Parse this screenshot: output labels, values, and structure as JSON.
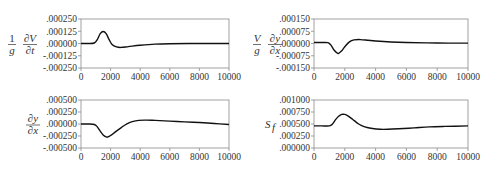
{
  "chart_data": [
    {
      "type": "line",
      "id": "dVdt",
      "ylabel": "1/g ∂V/∂t",
      "ylabel_parts": {
        "num_left": "1",
        "den_left": "g",
        "num_right": "∂V",
        "den_right": "∂t"
      },
      "xlabel": "",
      "xlim": [
        0,
        10000
      ],
      "ylim": [
        -0.00025,
        0.00025
      ],
      "xticks": [
        0,
        2000,
        4000,
        6000,
        8000,
        10000
      ],
      "xtick_labels": [
        "0",
        "2000",
        "4000",
        "6000",
        "8000",
        "10000"
      ],
      "yticks": [
        0.00025,
        0.000125,
        0,
        -0.000125,
        -0.00025
      ],
      "ytick_labels": [
        ".000250",
        ".000125",
        ".000000",
        "-.000125",
        "-.000250"
      ],
      "grid": false,
      "x": [
        0,
        500,
        900,
        1100,
        1300,
        1500,
        1700,
        1900,
        2100,
        2400,
        2700,
        3200,
        4000,
        5000,
        6000,
        8000,
        10000
      ],
      "y": [
        0,
        0,
        5e-06,
        4e-05,
        0.0001,
        0.000122,
        0.0001,
        4e-05,
        -1e-05,
        -3.5e-05,
        -4e-05,
        -3.2e-05,
        -1.8e-05,
        -6e-06,
        -2e-06,
        0,
        0
      ]
    },
    {
      "type": "line",
      "id": "V_g_dydx",
      "ylabel": "V/g ∂y/∂x",
      "ylabel_parts": {
        "num_left": "V",
        "den_left": "g",
        "num_right": "∂y",
        "den_right": "∂x"
      },
      "xlabel": "",
      "xlim": [
        0,
        10000
      ],
      "ylim": [
        -0.00015,
        0.00015
      ],
      "xticks": [
        0,
        2000,
        4000,
        6000,
        8000,
        10000
      ],
      "xtick_labels": [
        "0",
        "2000",
        "4000",
        "6000",
        "8000",
        "10000"
      ],
      "yticks": [
        0.00015,
        7.5e-05,
        0,
        -7.5e-05,
        -0.00015
      ],
      "ytick_labels": [
        ".000150",
        ".000075",
        ".000000",
        "-.000075",
        "-.000150"
      ],
      "grid": false,
      "x": [
        0,
        500,
        900,
        1100,
        1300,
        1500,
        1600,
        1800,
        2000,
        2300,
        2600,
        3000,
        3500,
        4000,
        5000,
        6000,
        8000,
        10000
      ],
      "y": [
        6e-06,
        6e-06,
        5e-06,
        -1e-05,
        -4e-05,
        -5.8e-05,
        -6e-05,
        -4.5e-05,
        -2e-05,
        1e-05,
        2.2e-05,
        2.4e-05,
        2e-05,
        1.5e-05,
        9e-06,
        6e-06,
        3e-06,
        2e-06
      ]
    },
    {
      "type": "line",
      "id": "dydx",
      "ylabel": "∂y/∂x",
      "ylabel_parts": {
        "num": "∂y",
        "den": "∂x"
      },
      "xlabel": "",
      "xlim": [
        0,
        10000
      ],
      "ylim": [
        -0.0005,
        0.0005
      ],
      "xticks": [
        0,
        2000,
        4000,
        6000,
        8000,
        10000
      ],
      "xtick_labels": [
        "0",
        "2000",
        "4000",
        "6000",
        "8000",
        "10000"
      ],
      "yticks": [
        0.0005,
        0.00025,
        0,
        -0.00025,
        -0.0005
      ],
      "ytick_labels": [
        ".000500",
        ".000250",
        ".000000",
        "-.000250",
        "-.000500"
      ],
      "grid": false,
      "x": [
        0,
        500,
        900,
        1100,
        1300,
        1500,
        1700,
        1800,
        2000,
        2300,
        2700,
        3100,
        3600,
        4300,
        5000,
        6000,
        7000,
        8000,
        9000,
        10000
      ],
      "y": [
        0,
        0,
        -1e-05,
        -6e-05,
        -0.00015,
        -0.00023,
        -0.00027,
        -0.00027,
        -0.00024,
        -0.00017,
        -8e-05,
        5e-06,
        6e-05,
        8e-05,
        7.5e-05,
        6e-05,
        4.5e-05,
        3e-05,
        1e-05,
        -1e-05
      ]
    },
    {
      "type": "line",
      "id": "Sf",
      "ylabel": "S_f",
      "ylabel_parts": {
        "main": "S",
        "sub": "f"
      },
      "xlabel": "",
      "xlim": [
        0,
        10000
      ],
      "ylim": [
        0,
        0.001
      ],
      "xticks": [
        0,
        2000,
        4000,
        6000,
        8000,
        10000
      ],
      "xtick_labels": [
        "0",
        "2000",
        "4000",
        "6000",
        "8000",
        "10000"
      ],
      "yticks": [
        0.001,
        0.00075,
        0.0005,
        0.00025,
        0
      ],
      "ytick_labels": [
        ".001000",
        ".000750",
        ".000500",
        ".000250",
        ".000000"
      ],
      "grid": false,
      "x": [
        0,
        500,
        1000,
        1200,
        1400,
        1600,
        1800,
        2000,
        2200,
        2500,
        2900,
        3300,
        3800,
        4300,
        4800,
        5500,
        6500,
        7500,
        8500,
        10000
      ],
      "y": [
        0.00046,
        0.00046,
        0.00046,
        0.0005,
        0.00059,
        0.00066,
        0.0007,
        0.0007,
        0.00067,
        0.0006,
        0.0005,
        0.00044,
        0.000405,
        0.00039,
        0.00039,
        0.0004,
        0.00042,
        0.00044,
        0.00045,
        0.00046
      ]
    }
  ]
}
